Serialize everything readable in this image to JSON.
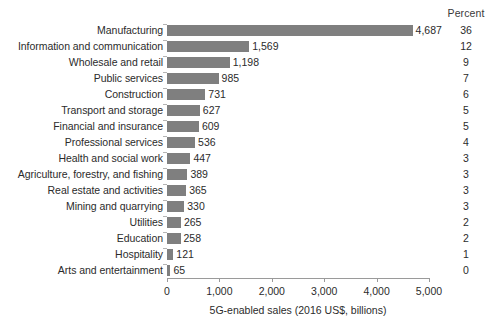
{
  "chart_data": {
    "type": "bar",
    "orientation": "horizontal",
    "title": "",
    "subtitle": "",
    "xlabel": "5G-enabled sales (2016 US$, billions)",
    "ylabel": "",
    "xlim": [
      0,
      5000
    ],
    "xticks": [
      0,
      1000,
      2000,
      3000,
      4000,
      5000
    ],
    "xtick_labels": [
      "0",
      "1,000",
      "2,000",
      "3,000",
      "4,000",
      "5,000"
    ],
    "grid": false,
    "legend": false,
    "bar_color": "#7f7f7f",
    "text_color": "#2b2b2b",
    "axis_color": "#9a9a9a",
    "extra_column_header": "Percent",
    "categories": [
      "Manufacturing",
      "Information and communication",
      "Wholesale and retail",
      "Public services",
      "Construction",
      "Transport and storage",
      "Financial and insurance",
      "Professional services",
      "Health and social work",
      "Agriculture, forestry, and fishing",
      "Real estate and activities",
      "Mining and quarrying",
      "Utilities",
      "Education",
      "Hospitality",
      "Arts and entertainment"
    ],
    "values": [
      4687,
      1569,
      1198,
      985,
      731,
      627,
      609,
      536,
      447,
      389,
      365,
      330,
      265,
      258,
      121,
      65
    ],
    "value_labels": [
      "4,687",
      "1,569",
      "1,198",
      "985",
      "731",
      "627",
      "609",
      "536",
      "447",
      "389",
      "365",
      "330",
      "265",
      "258",
      "121",
      "65"
    ],
    "percent_values": [
      36,
      12,
      9,
      7,
      6,
      5,
      5,
      4,
      3,
      3,
      3,
      3,
      2,
      2,
      1,
      0
    ],
    "percent_labels": [
      "36",
      "12",
      "9",
      "7",
      "6",
      "5",
      "5",
      "4",
      "3",
      "3",
      "3",
      "3",
      "2",
      "2",
      "1",
      "0"
    ]
  }
}
